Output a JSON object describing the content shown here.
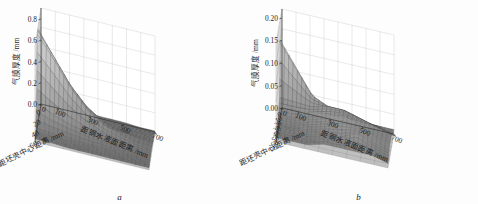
{
  "figure": {
    "panels": [
      {
        "id": "a",
        "caption": "a",
        "zlabel": "气膜厚度 /mm",
        "xlabel": "距坯壳中心距离 /mm",
        "ylabel": "距钢水液面距离 /mm",
        "ztick_labels": [
          "0.0",
          "0.2",
          "0.4",
          "0.6",
          "0.8"
        ],
        "xtick_labels": [
          "0",
          "20",
          "40",
          "60"
        ],
        "ytick_labels": [
          "0",
          "100",
          "300",
          "500",
          "700"
        ]
      },
      {
        "id": "b",
        "caption": "b",
        "zlabel": "气膜厚度 /mm",
        "xlabel": "距坯壳中心距离 /mm",
        "ylabel": "距钢水液面距离 /mm",
        "ztick_labels": [
          "0.00",
          "0.05",
          "0.10",
          "0.15",
          "0.20"
        ],
        "xtick_labels": [
          "0",
          "10",
          "20",
          "30",
          "40",
          "50",
          "60",
          "70"
        ],
        "ytick_labels": [
          "0",
          "100",
          "300",
          "500",
          "700"
        ]
      }
    ],
    "colors": {
      "grid": "#9b9b9b",
      "axis": "#2a2a2a",
      "mesh_dark": "#3a3a3a",
      "surface_fill": "#8d8d8d",
      "background": "#ffffff",
      "text": "#1d1d1d"
    }
  },
  "chart_data": [
    {
      "type": "surface",
      "panel": "a",
      "title": "",
      "xlabel": "距坯壳中心距离 /mm",
      "ylabel": "距钢水液面距离 /mm",
      "zlabel": "气膜厚度 /mm",
      "xlim": [
        0,
        70
      ],
      "ylim": [
        0,
        700
      ],
      "zlim": [
        0.0,
        0.9
      ],
      "grid": true,
      "legend": "none",
      "x": [
        0,
        10,
        20,
        30,
        40,
        50,
        60,
        70
      ],
      "y": [
        0,
        100,
        200,
        300,
        400,
        500,
        600,
        700
      ],
      "z_note": "气膜厚度 in mm; rows indexed by y (distance from steel surface), columns by x (distance from shell center). Sharp ridge/peak located near x=30-40 mm at small y, reaching ~0.88 mm; values fall to near 0.02-0.08 mm elsewhere.",
      "z": [
        [
          0.02,
          0.03,
          0.05,
          0.86,
          0.88,
          0.3,
          0.06,
          0.03
        ],
        [
          0.02,
          0.03,
          0.05,
          0.62,
          0.68,
          0.22,
          0.05,
          0.03
        ],
        [
          0.02,
          0.03,
          0.04,
          0.4,
          0.45,
          0.16,
          0.05,
          0.02
        ],
        [
          0.02,
          0.02,
          0.04,
          0.24,
          0.28,
          0.12,
          0.04,
          0.02
        ],
        [
          0.02,
          0.02,
          0.03,
          0.14,
          0.17,
          0.09,
          0.04,
          0.02
        ],
        [
          0.02,
          0.02,
          0.03,
          0.09,
          0.11,
          0.07,
          0.03,
          0.02
        ],
        [
          0.01,
          0.02,
          0.03,
          0.06,
          0.07,
          0.05,
          0.03,
          0.02
        ],
        [
          0.01,
          0.02,
          0.02,
          0.04,
          0.05,
          0.04,
          0.03,
          0.02
        ]
      ],
      "zmax_value": 0.88,
      "zmax_at": {
        "x": 35,
        "y": 0
      }
    },
    {
      "type": "surface",
      "panel": "b",
      "title": "",
      "xlabel": "距坯壳中心距离 /mm",
      "ylabel": "距钢水液面距离 /mm",
      "zlabel": "气膜厚度 /mm",
      "xlim": [
        0,
        70
      ],
      "ylim": [
        0,
        700
      ],
      "zlim": [
        0.0,
        0.22
      ],
      "grid": true,
      "legend": "none",
      "x": [
        0,
        10,
        20,
        30,
        40,
        50,
        60,
        70
      ],
      "y": [
        0,
        100,
        200,
        300,
        400,
        500,
        600,
        700
      ],
      "z_note": "气膜厚度 in mm; narrow tall spike near x=20 mm at y=0 reaching ~0.19 mm, broad low mound peaking ~0.06 mm mid-field, plus small secondary bump ~0.05 mm near x=55 mm, y=500 mm.",
      "z": [
        [
          0.01,
          0.02,
          0.19,
          0.05,
          0.03,
          0.02,
          0.02,
          0.01
        ],
        [
          0.01,
          0.02,
          0.13,
          0.05,
          0.03,
          0.02,
          0.02,
          0.01
        ],
        [
          0.01,
          0.02,
          0.07,
          0.05,
          0.04,
          0.03,
          0.02,
          0.01
        ],
        [
          0.01,
          0.03,
          0.05,
          0.06,
          0.05,
          0.04,
          0.03,
          0.02
        ],
        [
          0.01,
          0.03,
          0.05,
          0.06,
          0.06,
          0.05,
          0.03,
          0.02
        ],
        [
          0.01,
          0.02,
          0.04,
          0.05,
          0.05,
          0.05,
          0.05,
          0.02
        ],
        [
          0.01,
          0.02,
          0.03,
          0.04,
          0.04,
          0.04,
          0.03,
          0.02
        ],
        [
          0.01,
          0.01,
          0.02,
          0.03,
          0.03,
          0.03,
          0.02,
          0.01
        ]
      ],
      "zmax_value": 0.19,
      "zmax_at": {
        "x": 20,
        "y": 0
      }
    }
  ]
}
